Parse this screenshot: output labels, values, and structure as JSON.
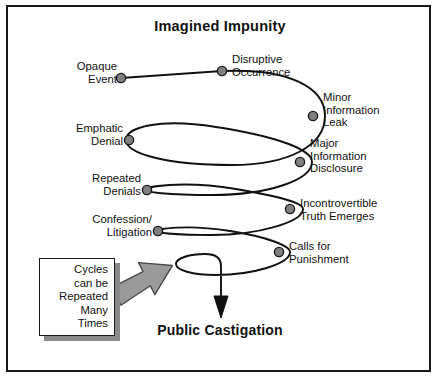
{
  "diagram": {
    "title": "Imagined Impunity",
    "outcome": "Public Castigation",
    "note": "Cycles\ncan be\nRepeated\nMany\nTimes",
    "colors": {
      "frame": "#1a1a1a",
      "spiral": "#111111",
      "node_fill": "#808080",
      "node_stroke": "#1a1a1a",
      "callout_arrow": "#9a9a9a",
      "box_shadow": "#8a8a8a",
      "background": "#ffffff"
    },
    "stages": [
      {
        "id": "opaque-event",
        "label": "Opaque\nEvent",
        "side": "left",
        "dot": {
          "x": 121,
          "y": 78
        },
        "text": {
          "x": 68,
          "y": 60,
          "width": 49
        }
      },
      {
        "id": "disruptive-occurrence",
        "label": "Disruptive\nOccurrence",
        "side": "right",
        "dot": {
          "x": 222,
          "y": 71
        },
        "text": {
          "x": 232,
          "y": 53,
          "width": 76
        }
      },
      {
        "id": "minor-information-leak",
        "label": "Minor\nInformation\nLeak",
        "side": "right",
        "dot": {
          "x": 313,
          "y": 116
        },
        "text": {
          "x": 323,
          "y": 91,
          "width": 78
        }
      },
      {
        "id": "emphatic-denial",
        "label": "Emphatic\nDenial",
        "side": "left",
        "dot": {
          "x": 129,
          "y": 140
        },
        "text": {
          "x": 64,
          "y": 122,
          "width": 61
        }
      },
      {
        "id": "major-information-disclosure",
        "label": "Major\nInformation\nDisclosure",
        "side": "right",
        "dot": {
          "x": 300,
          "y": 162
        },
        "text": {
          "x": 310,
          "y": 137,
          "width": 80
        }
      },
      {
        "id": "repeated-denials",
        "label": "Repeated\nDenials",
        "side": "left",
        "dot": {
          "x": 147,
          "y": 190
        },
        "text": {
          "x": 79,
          "y": 172,
          "width": 64
        }
      },
      {
        "id": "incontrovertible-truth-emerges",
        "label": "Incontrovertible\nTruth Emerges",
        "side": "right",
        "dot": {
          "x": 290,
          "y": 209
        },
        "text": {
          "x": 300,
          "y": 197,
          "width": 98
        }
      },
      {
        "id": "confession-litigation",
        "label": "Confession/\nLitigation",
        "side": "left",
        "dot": {
          "x": 158,
          "y": 231
        },
        "text": {
          "x": 83,
          "y": 213,
          "width": 71
        }
      },
      {
        "id": "calls-for-punishment",
        "label": "Calls for\nPunishment",
        "side": "right",
        "dot": {
          "x": 279,
          "y": 252
        },
        "text": {
          "x": 289,
          "y": 240,
          "width": 76
        }
      }
    ]
  }
}
